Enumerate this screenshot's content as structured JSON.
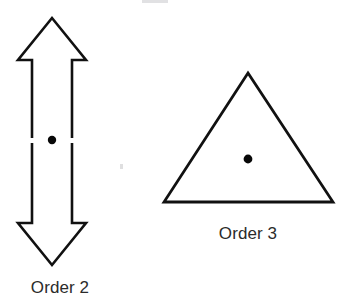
{
  "figure": {
    "background_color": "#ffffff",
    "ink_color": "#111111",
    "dot_color": "#080808",
    "caption_color": "#2b2b2b",
    "artifact_color": "#c9c9cc",
    "items": [
      {
        "id": "order-2",
        "shape": "double-headed-arrow",
        "caption": "Order 2",
        "caption_x": 60,
        "caption_y": 293,
        "center_dot": {
          "cx": 52,
          "cy": 140,
          "r": 4.2
        },
        "stroke_width": 2.6,
        "outline_points": "52,18 86,60 72,60 72,134 72,146 72,223 86,223 52,265 18,223 32,223 32,146 32,134 32,60 18,60",
        "gap_segments": [
          {
            "x": 29,
            "y": 138,
            "w": 6,
            "h": 5
          },
          {
            "x": 69,
            "y": 138,
            "w": 6,
            "h": 5
          }
        ]
      },
      {
        "id": "order-3",
        "shape": "triangle",
        "caption": "Order 3",
        "caption_x": 248,
        "caption_y": 239,
        "center_dot": {
          "cx": 248,
          "cy": 159,
          "r": 4.4
        },
        "stroke_width": 2.8,
        "outline_points": "248,73 333,202 164,202"
      }
    ],
    "artifacts": [
      {
        "id": "top-smudge",
        "x": 142,
        "y": 0,
        "w": 26,
        "h": 3,
        "opacity": 0.55
      },
      {
        "id": "mid-speck",
        "x": 120,
        "y": 164,
        "w": 3,
        "h": 5,
        "opacity": 0.6
      }
    ]
  }
}
